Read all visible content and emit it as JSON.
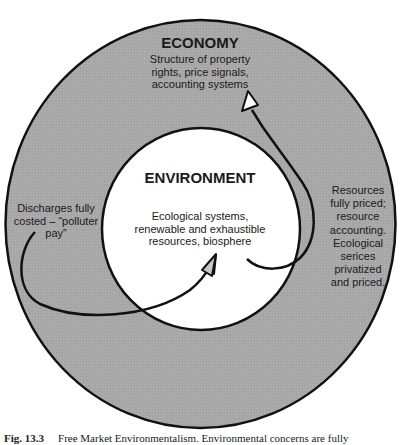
{
  "diagram": {
    "outer_circle": {
      "title": "ECONOMY",
      "description": "Structure of property\nrights, price signals,\naccounting systems",
      "fill": "#a9a9a9"
    },
    "inner_circle": {
      "title": "ENVIRONMENT",
      "description": "Ecological systems,\nrenewable and exhaustible\nresources, biosphere",
      "fill": "#ffffff"
    },
    "left_note": "Discharges fully\ncosted – “polluter\npay”",
    "right_note": "Resources\nfully priced;\nresource\naccounting.\nEcological\nserices\nprivatized\nand priced.",
    "arrows": [
      {
        "from": "left_note",
        "to": "inner_circle",
        "label": "discharges-arrow"
      },
      {
        "from": "inner_circle",
        "to": "outer_circle",
        "label": "resources-arrow"
      }
    ]
  },
  "caption": {
    "figure_number": "Fig. 13.3",
    "text": "Free Market Environmentalism. Environmental concerns are fully"
  }
}
